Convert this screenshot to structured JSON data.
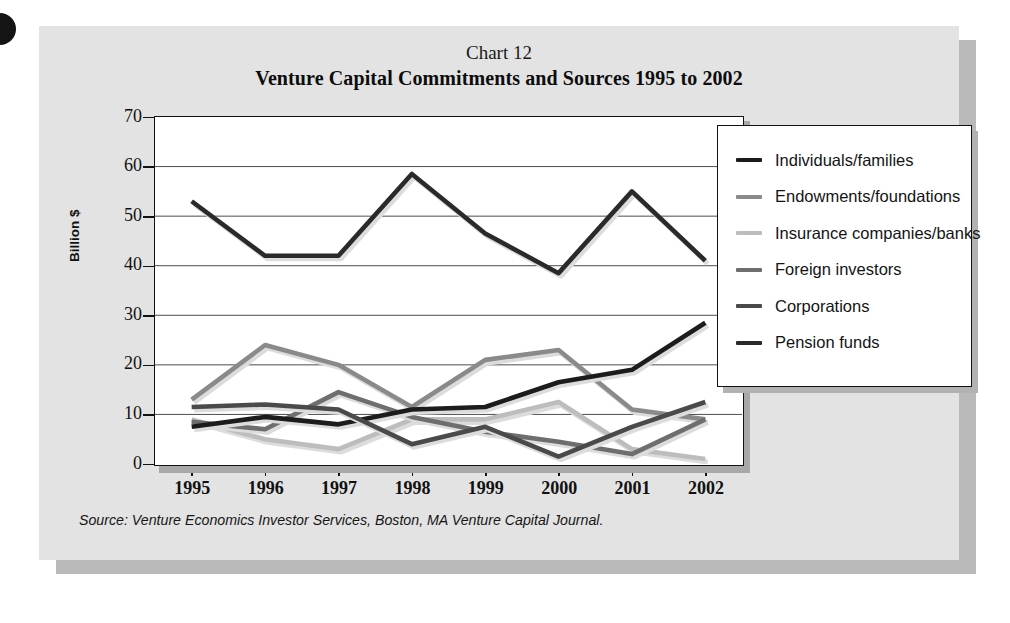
{
  "figure": {
    "chart_number": "Chart 12",
    "title": "Venture Capital Commitments and Sources 1995 to 2002",
    "source": "Source: Venture Economics Investor Services, Boston, MA Venture Capital Journal."
  },
  "axes": {
    "ylabel": "Billion $",
    "yticks": [
      "70",
      "60",
      "50",
      "40",
      "30",
      "20",
      "10",
      "0"
    ],
    "xticks": [
      "1995",
      "1996",
      "1997",
      "1998",
      "1999",
      "2000",
      "2001",
      "2002"
    ]
  },
  "legend": {
    "items": [
      {
        "label": "Individuals/families",
        "color": "#1c1c1c"
      },
      {
        "label": "Endowments/foundations",
        "color": "#8a8a8a"
      },
      {
        "label": "Insurance companies/banks",
        "color": "#bdbdbd"
      },
      {
        "label": "Foreign investors",
        "color": "#6e6e6e"
      },
      {
        "label": "Corporations",
        "color": "#4a4a4a"
      },
      {
        "label": "Pension funds",
        "color": "#2a2a2a"
      }
    ]
  },
  "chart_data": {
    "type": "line",
    "title": "Venture Capital Commitments and Sources 1995 to 2002",
    "subtitle": "Chart 12",
    "xlabel": "",
    "ylabel": "Billion $",
    "ylim": [
      0,
      70
    ],
    "ytick_step": 10,
    "grid": true,
    "legend_position": "right",
    "categories": [
      "1995",
      "1996",
      "1997",
      "1998",
      "1999",
      "2000",
      "2001",
      "2002"
    ],
    "series": [
      {
        "name": "Individuals/families",
        "color": "#1c1c1c",
        "values": [
          7.5,
          9.5,
          8.0,
          11.0,
          11.5,
          16.5,
          19.0,
          28.5
        ]
      },
      {
        "name": "Endowments/foundations",
        "color": "#8a8a8a",
        "values": [
          13.0,
          24.0,
          20.0,
          11.5,
          21.0,
          23.0,
          11.0,
          9.0
        ]
      },
      {
        "name": "Insurance companies/banks",
        "color": "#bdbdbd",
        "values": [
          9.0,
          5.0,
          3.0,
          9.0,
          9.0,
          12.5,
          3.0,
          1.0
        ]
      },
      {
        "name": "Foreign investors",
        "color": "#6e6e6e",
        "values": [
          8.5,
          7.0,
          14.5,
          9.5,
          6.5,
          4.5,
          2.0,
          9.0
        ]
      },
      {
        "name": "Corporations",
        "color": "#4a4a4a",
        "values": [
          11.5,
          12.0,
          11.0,
          4.0,
          7.5,
          1.5,
          7.5,
          12.5
        ]
      },
      {
        "name": "Pension funds",
        "color": "#2a2a2a",
        "values": [
          53.0,
          42.0,
          42.0,
          58.5,
          46.5,
          38.5,
          55.0,
          41.0
        ]
      }
    ]
  }
}
